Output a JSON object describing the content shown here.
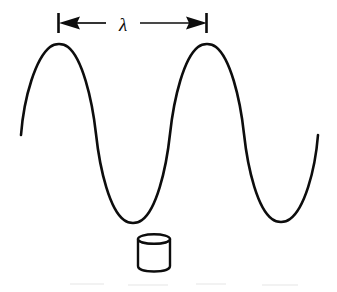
{
  "figure": {
    "background_color": "#ffffff",
    "ink_color": "#0d0d0d",
    "width": 337,
    "height": 292
  },
  "annotation": {
    "symbol": "λ",
    "symbol_name": "lambda",
    "meaning": "wavelength",
    "arrow_style": "double-headed with end ticks",
    "baseline_y": 23,
    "left_tick_x": 58,
    "right_tick_x": 207,
    "label_x": 123,
    "label_y": 30,
    "span_px": 149
  },
  "wave": {
    "shape": "sinusoid",
    "stroke_width": 2.6,
    "start_point": [
      21,
      135
    ],
    "end_point": [
      318,
      135
    ],
    "midline_y": 134,
    "amplitude_px": 90,
    "wavelength_px": 148,
    "crests": [
      {
        "x": 59,
        "y": 44
      },
      {
        "x": 207,
        "y": 44
      }
    ],
    "troughs": [
      {
        "x": 133,
        "y": 223
      },
      {
        "x": 281,
        "y": 222
      }
    ],
    "zero_crossings": [
      96,
      170,
      244,
      318
    ],
    "path": "M 21,135 C 24,96 36,58 50,47 C 55,43 63,43 68,47 C 82,58 92,98 96,134 C 100,171 110,210 124,220 C 129,224 137,224 142,220 C 156,210 166,171 170,134 C 174,97 184,58 198,47 C 203,43 211,43 216,47 C 230,58 240,97 244,134 C 248,171 258,209 272,219 C 277,223 285,223 290,219 C 304,209 315,172 318,135"
  },
  "cylinder": {
    "label": "cylinder",
    "description": "small open can / drum drawn below the wave trough",
    "center_x": 154,
    "top_y": 238,
    "bottom_y": 271,
    "radius_x": 16,
    "ellipse_ry": 5,
    "body_height": 33
  },
  "icons": {
    "arrow_left_head": "arrow-left-head-icon",
    "arrow_right_head": "arrow-right-head-icon",
    "tick_left": "tick-left-icon",
    "tick_right": "tick-right-icon",
    "cylinder": "cylinder-icon"
  },
  "chart_data": {
    "type": "line",
    "title": "",
    "xlabel": "",
    "ylabel": "",
    "annotations": [
      "λ"
    ],
    "series": [
      {
        "name": "wave",
        "x": [
          21,
          59,
          96,
          133,
          170,
          207,
          244,
          281,
          318
        ],
        "y": [
          135,
          44,
          134,
          223,
          134,
          44,
          134,
          222,
          135
        ]
      }
    ],
    "xlim": [
      0,
      337
    ],
    "ylim": [
      292,
      0
    ],
    "grid": false,
    "legend": "none"
  }
}
